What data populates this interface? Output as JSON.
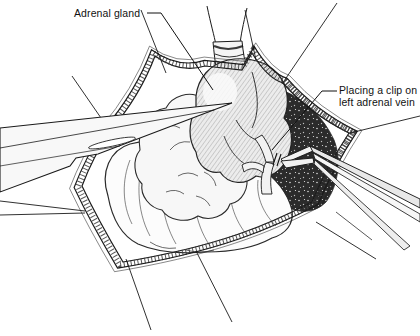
{
  "figure": {
    "background_color": "#ffffff",
    "ink_color": "#1a1a1a",
    "labels": {
      "adrenal_gland": {
        "text": "Adrenal gland"
      },
      "clip": {
        "line1": "Placing a clip on",
        "line2": "left adrenal vein"
      }
    }
  }
}
